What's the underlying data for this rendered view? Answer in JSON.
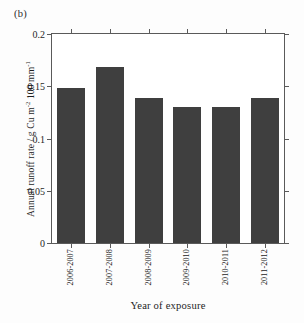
{
  "figure": {
    "panel_label": "(b)",
    "background_color": "#fdfdfd",
    "frame_color": "#5a5a5a"
  },
  "chart_data": {
    "type": "bar",
    "title": "",
    "subtitle": "",
    "panel": "(b)",
    "categories": [
      "2006-2007",
      "2007-2008",
      "2008-2009",
      "2009-2010",
      "2010-2011",
      "2011-2012"
    ],
    "values": [
      0.148,
      0.168,
      0.139,
      0.13,
      0.13,
      0.139
    ],
    "xlabel": "Year of exposure",
    "ylabel": "Annual runoff rate / g Cu m⁻² 100 mm⁻¹",
    "ylabel_parts": {
      "prefix": "Annual runoff rate / g Cu m",
      "sup1": "-2",
      "middle": " 100 mm",
      "sup2": "-1"
    },
    "ylim": [
      0,
      0.2
    ],
    "yticks": [
      0,
      0.05,
      0.1,
      0.15,
      0.2
    ],
    "ytick_labels": [
      "0",
      "0.05",
      "0.1",
      "0.15",
      "0.2"
    ],
    "grid": false,
    "legend": null,
    "bar_color": "#3f3f3f",
    "bar_width_ratio": 0.72,
    "axis_box": true,
    "tick_direction": "out"
  }
}
